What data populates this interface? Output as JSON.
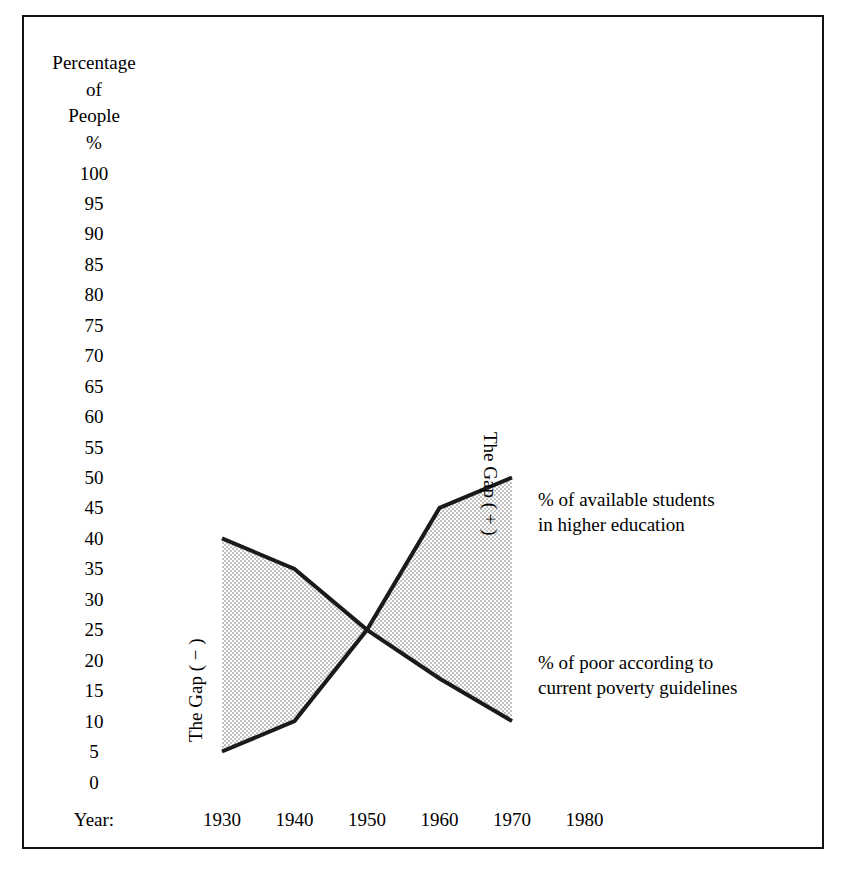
{
  "axis": {
    "y_title_lines": [
      "Percentage",
      "of",
      "People",
      "%"
    ],
    "y_ticks": [
      100,
      95,
      90,
      85,
      80,
      75,
      70,
      65,
      60,
      55,
      50,
      45,
      40,
      35,
      30,
      25,
      20,
      15,
      10,
      5,
      0
    ],
    "x_caption": "Year:",
    "x_ticks": [
      "1930",
      "1940",
      "1950",
      "1960",
      "1970",
      "1980"
    ]
  },
  "annotations": {
    "gap_negative": "The Gap ( − )",
    "gap_positive": "The Gap ( + )",
    "students_line1": "% of available students",
    "students_line2": "in higher education",
    "poverty_line1": "% of poor according to",
    "poverty_line2": "current poverty guidelines"
  },
  "colors": {
    "frame": "#111111",
    "line": "#1a1a1a",
    "fill": "#d7d7d7",
    "background": "#ffffff"
  },
  "chart_data": {
    "type": "line",
    "title": "",
    "subtitle": "",
    "xlabel": "Year:",
    "ylabel": "Percentage of People %",
    "x": [
      1930,
      1940,
      1950,
      1960,
      1970,
      1980
    ],
    "xlim": [
      1930,
      1980
    ],
    "ylim": [
      0,
      100
    ],
    "ytick_step": 5,
    "grid": false,
    "legend": "right-side callouts",
    "series": [
      {
        "name": "% of available students in higher education",
        "x": [
          1930,
          1940,
          1950,
          1960,
          1970
        ],
        "values": [
          5,
          10,
          25,
          45,
          50
        ]
      },
      {
        "name": "% of poor according to current poverty guidelines",
        "x": [
          1930,
          1940,
          1950,
          1960,
          1970
        ],
        "values": [
          40,
          35,
          25,
          17,
          10
        ]
      }
    ],
    "shaded_regions": [
      {
        "label": "The Gap ( − )",
        "x_range": [
          1930,
          1950
        ],
        "description": "area between the two series before they cross, poverty above students"
      },
      {
        "label": "The Gap ( + )",
        "x_range": [
          1950,
          1970
        ],
        "description": "area between the two series after they cross, students above poverty"
      }
    ],
    "crossover": {
      "x": 1950,
      "y": 25
    }
  }
}
